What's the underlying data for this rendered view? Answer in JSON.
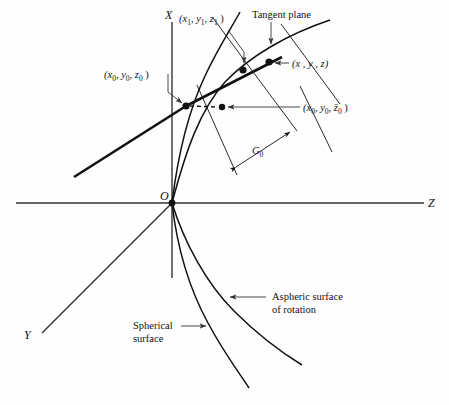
{
  "figure": {
    "background_color": "#fefefe",
    "ink_color": "#111111",
    "axes": {
      "x_label": "X",
      "y_label": "Y",
      "z_label": "Z",
      "origin_label": "O"
    },
    "labels": {
      "point_x1y1z1": "(x₁ , y₁ , z₁ )",
      "point_x0y0z0": "(x₀ , y₀ , z₀ )",
      "point_xyz": "(x , y , z)",
      "point_x0y0zbar0": "(x₀ , y₀ , z̄₀ )",
      "tangent_plane": "Tangent plane",
      "gap_g0": "G₀",
      "aspheric_line1": "Aspheric surface",
      "aspheric_line2": "of rotation",
      "spherical_line1": "Spherical",
      "spherical_line2": "surface"
    },
    "label_parts": {
      "x1y1z1": {
        "base": "(x",
        "sub1": "1",
        "mid1": ", y",
        "sub2": "1",
        "mid2": ", z",
        "sub3": "1",
        "close": " )"
      },
      "x0y0z0": {
        "base": "(x",
        "sub1": "0",
        "mid1": ", y",
        "sub2": "0",
        "mid2": ", z",
        "sub3": "0",
        "close": " )"
      },
      "x0y0zbar0": {
        "base": "(x",
        "sub1": "0",
        "mid1": ", y",
        "sub2": "0",
        "mid2": ", z̄",
        "sub3": "0",
        "close": " )"
      },
      "xyz": {
        "text": "(x , y , z)"
      },
      "g0": {
        "base": "G",
        "sub1": "0"
      }
    },
    "markers": [
      {
        "name": "point-x0y0z0-marker",
        "x": 186,
        "y": 106
      },
      {
        "name": "point-x0y0zbar0-marker",
        "x": 222,
        "y": 107
      },
      {
        "name": "point-x1y1z1-marker",
        "x": 243,
        "y": 70
      },
      {
        "name": "point-xyz-marker",
        "x": 269,
        "y": 62
      },
      {
        "name": "origin-marker",
        "x": 172,
        "y": 203
      }
    ]
  }
}
